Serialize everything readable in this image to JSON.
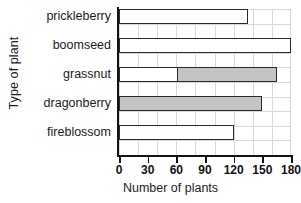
{
  "chart_data": {
    "type": "bar",
    "orientation": "horizontal",
    "title": "",
    "xlabel": "Number of plants",
    "ylabel": "Type of plant",
    "categories": [
      "prickleberry",
      "boomseed",
      "grassnut",
      "dragonberry",
      "fireblossom"
    ],
    "values": [
      135,
      180,
      165,
      150,
      120
    ],
    "series": [
      {
        "name": "Number of plants",
        "values": [
          135,
          180,
          165,
          150,
          120
        ]
      }
    ],
    "bar_fills": [
      "white",
      "white",
      "partial-gray",
      "gray",
      "white"
    ],
    "shaded_segments": [
      {
        "category": "grassnut",
        "from": 60,
        "to": 165
      },
      {
        "category": "dragonberry",
        "from": 0,
        "to": 150
      }
    ],
    "xlim": [
      0,
      180
    ],
    "xticks": [
      0,
      30,
      60,
      90,
      120,
      150,
      180
    ],
    "xtick_labels": [
      "0",
      "30",
      "60",
      "90",
      "120",
      "150",
      "180"
    ],
    "grid": true,
    "legend": null,
    "colors": {
      "bar_outline": "#2a2a2a",
      "bar_fill_white": "#ffffff",
      "bar_fill_gray": "#c4c4c4",
      "grid": "#b9b9b9",
      "axis": "#131313",
      "text": "#1b1b1b"
    }
  }
}
